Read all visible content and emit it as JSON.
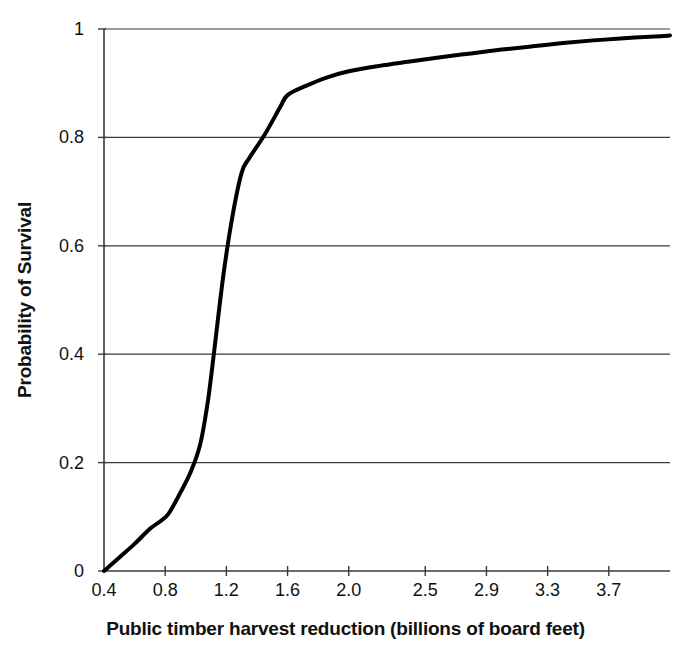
{
  "chart_data": {
    "type": "line",
    "title": "",
    "xlabel": "Public timber harvest reduction (billions of board feet)",
    "ylabel": "Probability of Survival",
    "xlim": [
      0.4,
      4.1
    ],
    "ylim": [
      0,
      1
    ],
    "xtick_labels": [
      "0.4",
      "0.8",
      "1.2",
      "1.6",
      "2.0",
      "2.5",
      "2.9",
      "3.3",
      "3.7"
    ],
    "xtick_values": [
      0.4,
      0.8,
      1.2,
      1.6,
      2.0,
      2.5,
      2.9,
      3.3,
      3.7
    ],
    "ytick_labels": [
      "0",
      "0.2",
      "0.4",
      "0.6",
      "0.8",
      "1"
    ],
    "ytick_values": [
      0,
      0.2,
      0.4,
      0.6,
      0.8,
      1
    ],
    "grid": "horizontal",
    "legend": "none",
    "line_color": "#000000",
    "line_width": 4,
    "series": [
      {
        "name": "Probability of survival",
        "x": [
          0.4,
          0.5,
          0.6,
          0.7,
          0.75,
          0.82,
          0.9,
          0.97,
          1.03,
          1.08,
          1.12,
          1.18,
          1.24,
          1.3,
          1.35,
          1.45,
          1.55,
          1.6,
          1.72,
          1.85,
          2.0,
          2.2,
          2.4,
          2.6,
          2.8,
          3.0,
          3.2,
          3.4,
          3.6,
          3.8,
          4.0,
          4.1
        ],
        "y": [
          0.0,
          0.025,
          0.05,
          0.078,
          0.088,
          0.105,
          0.145,
          0.185,
          0.235,
          0.315,
          0.405,
          0.545,
          0.655,
          0.735,
          0.762,
          0.805,
          0.855,
          0.878,
          0.895,
          0.91,
          0.922,
          0.932,
          0.94,
          0.948,
          0.955,
          0.962,
          0.968,
          0.974,
          0.979,
          0.983,
          0.986,
          0.988
        ]
      }
    ]
  },
  "axes": {
    "plot_left_px": 104,
    "plot_right_px": 670,
    "plot_top_px": 29,
    "plot_bottom_px": 571
  }
}
